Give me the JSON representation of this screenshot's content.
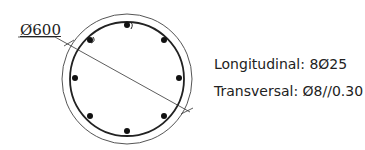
{
  "diagram": {
    "dimension_label": "Ø600",
    "longitudinal_text": "Longitudinal: 8Ø25",
    "transversal_text": "Transversal: Ø8//0.30",
    "bar_count": 8,
    "colors": {
      "line": "#222222",
      "outer": "#555555",
      "bar": "#111111"
    }
  }
}
